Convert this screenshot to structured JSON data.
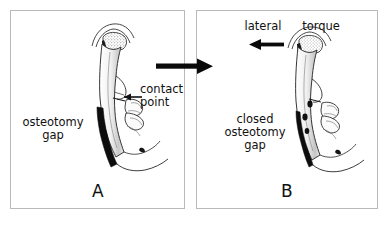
{
  "figure": {
    "type": "medical-illustration",
    "background_color": "#ffffff",
    "panel_border_color": "#b9b9b9",
    "ink_color": "#111111"
  },
  "panel_a": {
    "letter": "A",
    "labels": {
      "osteotomy_gap": "osteotomy\ngap",
      "contact_point": "contact\npoint"
    },
    "annotations": [
      {
        "name": "contact-point-arrow",
        "direction": "left",
        "style": "thin"
      }
    ]
  },
  "panel_b": {
    "letter": "B",
    "labels": {
      "lateral": "lateral",
      "torque": "torque",
      "closed_osteotomy_gap": "closed\nosteotomy\ngap"
    },
    "annotations": [
      {
        "name": "lateral-torque-arrow",
        "direction": "left",
        "style": "thick"
      }
    ]
  },
  "transition": {
    "arrow": {
      "name": "transition-arrow",
      "direction": "right",
      "style": "thick-block"
    }
  }
}
